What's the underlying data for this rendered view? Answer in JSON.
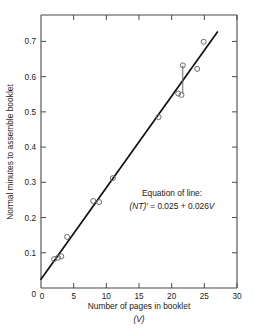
{
  "chart_data": {
    "type": "scatter",
    "title": "",
    "xlabel": "Number of pages in booklet",
    "xlabel_sub": "(V)",
    "ylabel": "Normal minutes to assemble booklet",
    "xlim": [
      0,
      30
    ],
    "ylim": [
      0,
      0.775
    ],
    "xticks": [
      0,
      5,
      10,
      15,
      20,
      25,
      30
    ],
    "xtick_labels": [
      "0",
      "5",
      "10",
      "15",
      "20",
      "25",
      "30"
    ],
    "yticks": [
      0,
      0.1,
      0.2,
      0.3,
      0.4,
      0.5,
      0.6,
      0.7
    ],
    "ytick_labels": [
      "0",
      "0.1",
      "0.2",
      "0.3",
      "0.4",
      "0.5",
      "0.6",
      "0.7"
    ],
    "grid": false,
    "legend": "none",
    "marker": "open-circle",
    "points": [
      {
        "x": 2.0,
        "y": 0.082
      },
      {
        "x": 2.6,
        "y": 0.086
      },
      {
        "x": 3.1,
        "y": 0.09
      },
      {
        "x": 4.0,
        "y": 0.145
      },
      {
        "x": 8.0,
        "y": 0.247
      },
      {
        "x": 8.9,
        "y": 0.244
      },
      {
        "x": 11.0,
        "y": 0.312
      },
      {
        "x": 18.0,
        "y": 0.485
      },
      {
        "x": 21.0,
        "y": 0.552
      },
      {
        "x": 21.5,
        "y": 0.548
      },
      {
        "x": 21.7,
        "y": 0.632
      },
      {
        "x": 23.9,
        "y": 0.622
      },
      {
        "x": 24.9,
        "y": 0.699
      }
    ],
    "connector_segments": [
      {
        "x": 21.7,
        "y1": 0.632,
        "y2": 0.552
      }
    ],
    "fit_line": {
      "intercept": 0.025,
      "slope": 0.026,
      "x_start": 0.0,
      "x_end": 27.0,
      "label_title": "Equation of line:",
      "label_equation_prefix": "(NT)′",
      "label_equation_body": " = 0.025 + 0.026",
      "label_equation_var": "V"
    }
  },
  "annotation": {
    "line1": "Equation of line:",
    "line2_italic_a": "(NT)′",
    "line2_plain": " = 0.025 + 0.026",
    "line2_italic_b": "V"
  },
  "colors": {
    "axis": "#4a4a4a",
    "line": "#111111",
    "marker_stroke": "#6b6b6b",
    "text": "#1a1a1a",
    "background": "#ffffff"
  }
}
